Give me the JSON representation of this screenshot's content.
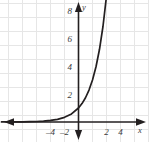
{
  "chart_data": {
    "type": "line",
    "title": "",
    "subtitle": "",
    "xlabel": "x",
    "ylabel": "y",
    "xlim": [
      -5.5,
      5.0
    ],
    "ylim": [
      -1.4,
      9.6
    ],
    "grid": true,
    "grid_step": 1,
    "legend": null,
    "x_ticks": [
      -4,
      -2,
      2,
      4
    ],
    "x_tick_labels": [
      "–4",
      "–2",
      "2",
      "4"
    ],
    "y_ticks": [
      2,
      4,
      6,
      8
    ],
    "y_tick_labels": [
      "2",
      "4",
      "6",
      "8"
    ],
    "series": [
      {
        "name": "exponential-curve",
        "equation": "y = 3^x",
        "color": "#231f20",
        "arrow_end": "up",
        "x": [
          -5.5,
          -5.0,
          -4.5,
          -4.0,
          -3.5,
          -3.0,
          -2.5,
          -2.0,
          -1.5,
          -1.0,
          -0.5,
          0.0,
          0.25,
          0.5,
          0.75,
          1.0,
          1.25,
          1.5,
          1.75,
          2.0,
          2.05
        ],
        "y": [
          0.005,
          0.008,
          0.014,
          0.012,
          0.021,
          0.037,
          0.064,
          0.111,
          0.192,
          0.333,
          0.577,
          1.0,
          1.316,
          1.732,
          2.279,
          3.0,
          3.948,
          5.196,
          6.839,
          9.0,
          9.45
        ]
      }
    ],
    "axes": {
      "x_axis_arrows": [
        "left",
        "right"
      ],
      "y_axis_arrows": [
        "up",
        "down"
      ],
      "axis_color": "#231f20",
      "grid_color": "#e6e6e6"
    },
    "colors": {
      "background": "#ffffff",
      "grid": "#e6e6e6",
      "axis": "#231f20",
      "curve": "#231f20",
      "label": "#3b3b3b"
    }
  }
}
